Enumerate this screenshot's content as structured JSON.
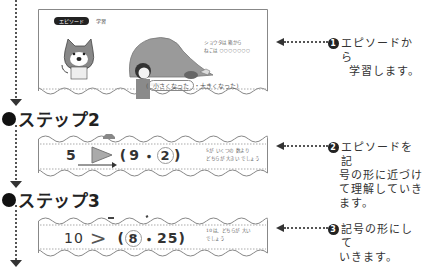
{
  "steps": [
    {
      "heading": null,
      "badge": "エピソード",
      "badge_label": "学習",
      "side_text": [
        "ショウタは 箱から",
        "ねこは ○○○○○○○"
      ],
      "episode_options": {
        "first": "小さくなった",
        "second": "大きくなった"
      },
      "callout": {
        "number": "1",
        "text_lines": [
          "エピソードから",
          "学習します。"
        ]
      }
    },
    {
      "heading": "ステップ2",
      "expression": {
        "left": "5",
        "symbol": ">",
        "open": "(",
        "a": "9",
        "sep": "・",
        "b": "2",
        "close": ")",
        "circled": "b"
      },
      "side_text": [
        "5が いくつの 数より",
        "どちらが 大きい でしょう"
      ],
      "callout": {
        "number": "2",
        "text_lines": [
          "エピソードを記",
          "号の形に近づけ",
          "て理解していき",
          "ます。"
        ]
      }
    },
    {
      "heading": "ステップ3",
      "expression": {
        "left": "10",
        "symbol": ">",
        "open": "(",
        "a": "8",
        "sep": "・",
        "b": "25",
        "close": ")",
        "circled": "a"
      },
      "side_text": [
        "10は、どちらが 大い",
        "でしょう"
      ],
      "callout": {
        "number": "3",
        "text_lines": [
          "記号の形にして",
          "いきます。"
        ]
      }
    }
  ],
  "colors": {
    "ink": "#222222",
    "frame": "#888888",
    "illustration_gray": "#9a9a9a"
  }
}
